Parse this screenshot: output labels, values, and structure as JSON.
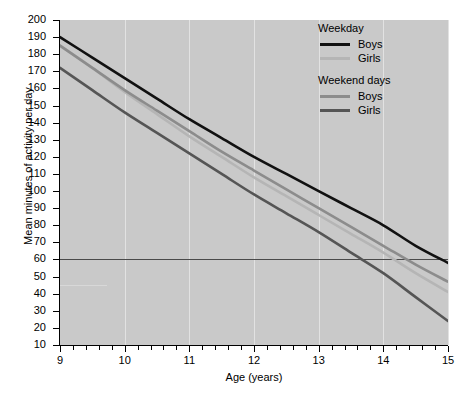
{
  "chart_data": {
    "type": "line",
    "title": "",
    "xlabel": "Age (years)",
    "ylabel": "Mean minutes of activity per day",
    "xlim": [
      9,
      15
    ],
    "ylim": [
      10,
      200
    ],
    "xticks": [
      9,
      10,
      11,
      12,
      13,
      14,
      15
    ],
    "xtick_labels": [
      "9",
      "10",
      "11",
      "12",
      "13",
      "14",
      "15"
    ],
    "xminor_step": 0.2,
    "yticks": [
      10,
      20,
      30,
      40,
      50,
      60,
      70,
      80,
      90,
      100,
      110,
      120,
      130,
      140,
      150,
      160,
      170,
      180,
      190,
      200
    ],
    "ytick_labels": [
      "10",
      "20",
      "30",
      "40",
      "50",
      "60",
      "70",
      "80",
      "90",
      "100",
      "110",
      "120",
      "130",
      "140",
      "150",
      "160",
      "170",
      "180",
      "190",
      "200"
    ],
    "grid": "vertical-only",
    "plot_background": "#c9c9c9",
    "legend_position": "top-right",
    "reference_lines": [
      {
        "name": "guideline-60-min",
        "orientation": "horizontal",
        "value": 60,
        "color": "#4a4a4a",
        "span": "full"
      },
      {
        "name": "short-marker-45",
        "orientation": "horizontal",
        "value": 45,
        "color": "#d8d8d8",
        "span": "partial",
        "x_from": 9.0,
        "x_to": 9.72
      }
    ],
    "x": [
      9,
      9.5,
      10,
      10.5,
      11,
      11.5,
      12,
      12.5,
      13,
      13.5,
      14,
      14.5,
      15
    ],
    "series": [
      {
        "name": "Weekday Boys",
        "group": "Weekday",
        "label": "Boys",
        "color": "#111111",
        "values": [
          190,
          178,
          166,
          154,
          142,
          131,
          120,
          110,
          100,
          90,
          80,
          68,
          58
        ]
      },
      {
        "name": "Weekend days Boys",
        "group": "Weekend days",
        "label": "Boys",
        "color": "#8c8c8c",
        "values": [
          185,
          172,
          159,
          147,
          135,
          123,
          112,
          101,
          90,
          79,
          68,
          57,
          47
        ]
      },
      {
        "name": "Weekday Girls",
        "group": "Weekday",
        "label": "Girls",
        "color": "#b5b5b5",
        "values": [
          185,
          172,
          158,
          145,
          132,
          120,
          108,
          97,
          86,
          75,
          64,
          52,
          41
        ]
      },
      {
        "name": "Weekend days Girls",
        "group": "Weekend days",
        "label": "Girls",
        "color": "#555555",
        "values": [
          172,
          159,
          146,
          134,
          122,
          110,
          98,
          87,
          76,
          64,
          52,
          38,
          24
        ]
      }
    ]
  },
  "legend": {
    "groups": [
      {
        "title": "Weekday",
        "entries": [
          {
            "label": "Boys",
            "color": "#111111"
          },
          {
            "label": "Girls",
            "color": "#b5b5b5"
          }
        ]
      },
      {
        "title": "Weekend days",
        "entries": [
          {
            "label": "Boys",
            "color": "#8c8c8c"
          },
          {
            "label": "Girls",
            "color": "#555555"
          }
        ]
      }
    ]
  }
}
